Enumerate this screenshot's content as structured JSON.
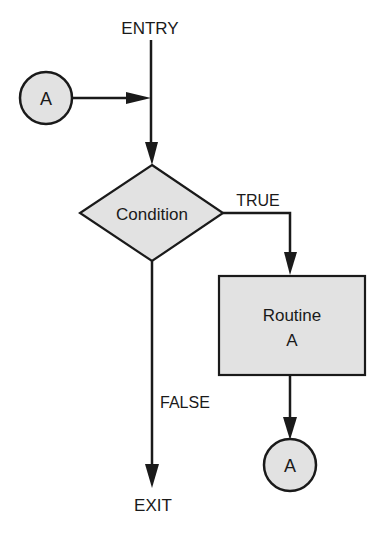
{
  "diagram": {
    "type": "flowchart",
    "colors": {
      "stroke": "#1a1a1a",
      "shape_fill": "#e2e2e2",
      "background": "#ffffff"
    },
    "labels": {
      "entry": "ENTRY",
      "exit": "EXIT",
      "condition": "Condition",
      "true_branch": "TRUE",
      "false_branch": "FALSE",
      "routine_line1": "Routine",
      "routine_line2": "A",
      "connector_in": "A",
      "connector_out": "A"
    },
    "nodes": [
      {
        "id": "entry",
        "shape": "terminal-label",
        "text": "ENTRY"
      },
      {
        "id": "connector_in",
        "shape": "circle",
        "text": "A"
      },
      {
        "id": "condition",
        "shape": "diamond",
        "text": "Condition"
      },
      {
        "id": "routine",
        "shape": "rectangle",
        "text": "Routine A"
      },
      {
        "id": "connector_out",
        "shape": "circle",
        "text": "A"
      },
      {
        "id": "exit",
        "shape": "terminal-label",
        "text": "EXIT"
      }
    ],
    "edges": [
      {
        "from": "entry",
        "to": "condition",
        "label": ""
      },
      {
        "from": "connector_in",
        "to": "entry-line",
        "label": ""
      },
      {
        "from": "condition",
        "to": "routine",
        "label": "TRUE"
      },
      {
        "from": "condition",
        "to": "exit",
        "label": "FALSE"
      },
      {
        "from": "routine",
        "to": "connector_out",
        "label": ""
      }
    ]
  }
}
